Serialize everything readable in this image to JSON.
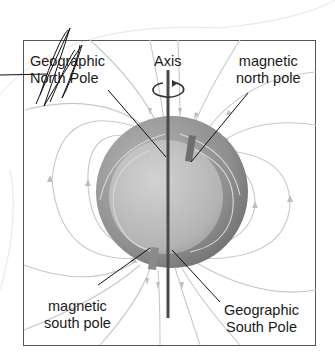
{
  "diagram": {
    "labels": {
      "axis": "Axis",
      "geographic_north": [
        "Geographic",
        "North Pole"
      ],
      "magnetic_north": [
        "magnetic",
        "north pole"
      ],
      "magnetic_south": [
        "magnetic",
        "south pole"
      ],
      "geographic_south": [
        "Geographic",
        "South Pole"
      ]
    },
    "colors": {
      "frame": "#555555",
      "field_lines": "#c8c8c8",
      "outer_sphere": "#8e8e8e",
      "inner_sphere": "#bdbdbd",
      "axis": "#4a4a4a",
      "magnet_bar": "#6e6e6e",
      "leader_lines": "#111111"
    },
    "annotation": "hand-drawn scribble over Geographic North Pole label"
  }
}
